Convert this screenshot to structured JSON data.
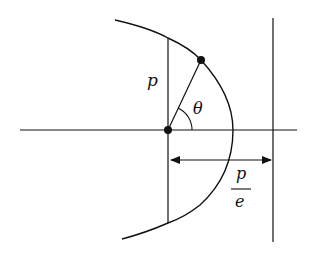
{
  "diagram": {
    "labels": {
      "semi_latus_rectum": "p",
      "angle": "θ",
      "distance_numerator": "p",
      "distance_denominator": "e"
    },
    "elements": {
      "axis": "horizontal axis through focus",
      "focus": "focus point at origin",
      "curve_point": "point on conic at angle θ",
      "latus_rectum": "vertical chord through focus of length 2p",
      "directrix": "vertical line at distance p/e from focus",
      "distance_arrow": "double-headed arrow from focus to directrix"
    },
    "colors": {
      "stroke": "#111111",
      "background": "#ffffff"
    }
  }
}
